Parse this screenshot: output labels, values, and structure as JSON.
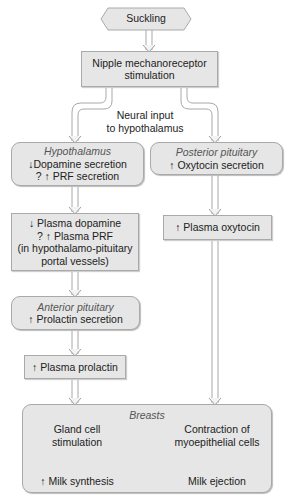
{
  "diagram": {
    "start": "Suckling",
    "nipple": {
      "line1": "Nipple mechanoreceptor",
      "line2": "stimulation"
    },
    "neural_label": {
      "line1": "Neural input",
      "line2": "to hypothalamus"
    },
    "hypothalamus": {
      "title": "Hypothalamus",
      "line1": "↓Dopamine secretion",
      "line2": "? ↑ PRF secretion"
    },
    "posterior_pituitary": {
      "title": "Posterior pituitary",
      "line1": "↑ Oxytocin secretion"
    },
    "plasma_dopamine": {
      "line1": "↓ Plasma dopamine",
      "line2": "? ↑ Plasma PRF",
      "line3": "(in hypothalamo-pituitary",
      "line4": "portal vessels)"
    },
    "plasma_oxytocin": {
      "line1": "↑ Plasma oxytocin"
    },
    "anterior_pituitary": {
      "title": "Anterior pituitary",
      "line1": "↑ Prolactin secretion"
    },
    "plasma_prolactin": {
      "line1": "↑ Plasma prolactin"
    },
    "breasts": {
      "title": "Breasts",
      "left": {
        "line1": "Gland cell",
        "line2": "stimulation",
        "result": "↑ Milk synthesis"
      },
      "right": {
        "line1": "Contraction of",
        "line2": "myoepithelial cells",
        "result": "Milk ejection"
      }
    }
  }
}
